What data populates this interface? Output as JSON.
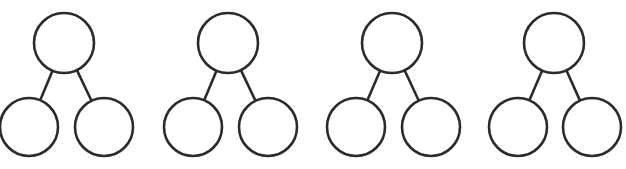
{
  "diagram": {
    "type": "tree-set",
    "stroke_color": "#2b2b2b",
    "fill_color": "#ffffff",
    "trees": [
      {
        "parent": {
          "cx": 64,
          "cy": 43,
          "r": 30
        },
        "children": [
          {
            "cx": 29,
            "cy": 127,
            "r": 29
          },
          {
            "cx": 104,
            "cy": 127,
            "r": 29
          }
        ]
      },
      {
        "parent": {
          "cx": 228,
          "cy": 43,
          "r": 30
        },
        "children": [
          {
            "cx": 193,
            "cy": 127,
            "r": 29
          },
          {
            "cx": 268,
            "cy": 127,
            "r": 29
          }
        ]
      },
      {
        "parent": {
          "cx": 392,
          "cy": 43,
          "r": 30
        },
        "children": [
          {
            "cx": 356,
            "cy": 127,
            "r": 29
          },
          {
            "cx": 431,
            "cy": 127,
            "r": 29
          }
        ]
      },
      {
        "parent": {
          "cx": 554,
          "cy": 43,
          "r": 30
        },
        "children": [
          {
            "cx": 518,
            "cy": 127,
            "r": 29
          },
          {
            "cx": 592,
            "cy": 127,
            "r": 29
          }
        ]
      }
    ]
  }
}
